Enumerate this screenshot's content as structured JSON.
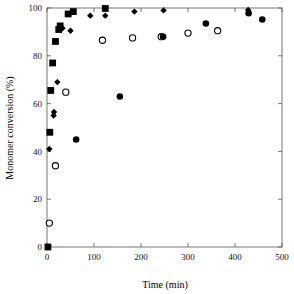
{
  "chart_data": {
    "type": "scatter",
    "title": "",
    "xlabel": "Time (min)",
    "ylabel": "Monomer conversion (%)",
    "xlim": [
      0,
      500
    ],
    "ylim": [
      0,
      100
    ],
    "xticks": [
      0,
      100,
      200,
      300,
      400,
      500
    ],
    "yticks": [
      0,
      20,
      40,
      60,
      80,
      100
    ],
    "xticklabels": [
      "0",
      "100",
      "200",
      "300",
      "400",
      "500"
    ],
    "yticklabels": [
      "0",
      "20",
      "40",
      "60",
      "80",
      "100"
    ],
    "grid": false,
    "legend": "none",
    "series": [
      {
        "name": "filled-square",
        "marker": "square",
        "fill": "#000000",
        "points": [
          {
            "x": 2,
            "y": 0
          },
          {
            "x": 6,
            "y": 48
          },
          {
            "x": 8,
            "y": 65.5
          },
          {
            "x": 12,
            "y": 77
          },
          {
            "x": 18,
            "y": 86
          },
          {
            "x": 25,
            "y": 91
          },
          {
            "x": 28,
            "y": 92.5
          },
          {
            "x": 45,
            "y": 97.5
          },
          {
            "x": 56,
            "y": 98.5
          },
          {
            "x": 124,
            "y": 99.8
          }
        ]
      },
      {
        "name": "filled-diamond",
        "marker": "diamond",
        "fill": "#000000",
        "points": [
          {
            "x": 5,
            "y": 41
          },
          {
            "x": 14,
            "y": 55
          },
          {
            "x": 15,
            "y": 56.5
          },
          {
            "x": 22,
            "y": 69
          },
          {
            "x": 33,
            "y": 91.5
          },
          {
            "x": 50,
            "y": 90.5
          },
          {
            "x": 92,
            "y": 96.8
          },
          {
            "x": 124,
            "y": 96.8
          },
          {
            "x": 186,
            "y": 98.5
          },
          {
            "x": 248,
            "y": 99
          },
          {
            "x": 428,
            "y": 99.2
          }
        ]
      },
      {
        "name": "open-circle",
        "marker": "circle-open",
        "fill": "#ffffff",
        "points": [
          {
            "x": 5,
            "y": 10
          },
          {
            "x": 18,
            "y": 34
          },
          {
            "x": 40,
            "y": 64.8
          },
          {
            "x": 118,
            "y": 86.5
          },
          {
            "x": 182,
            "y": 87.5
          },
          {
            "x": 243,
            "y": 88
          },
          {
            "x": 300,
            "y": 89.5
          },
          {
            "x": 363,
            "y": 90.5
          }
        ]
      },
      {
        "name": "filled-circle",
        "marker": "circle-filled",
        "fill": "#000000",
        "points": [
          {
            "x": 62,
            "y": 45
          },
          {
            "x": 155,
            "y": 63
          },
          {
            "x": 247,
            "y": 88
          },
          {
            "x": 338,
            "y": 93.5
          },
          {
            "x": 429,
            "y": 97.8
          },
          {
            "x": 458,
            "y": 95.2
          }
        ]
      }
    ]
  },
  "axes": {
    "x_title": "Time (min)",
    "y_title": "Monomer conversion (%)"
  }
}
